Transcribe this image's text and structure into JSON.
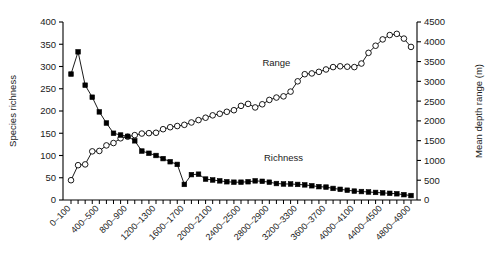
{
  "chart_data": {
    "type": "line",
    "title": "",
    "xlabel": "",
    "ylabel": "Species richness",
    "y2label": "Mean depth range (m)",
    "ylim": [
      0,
      400
    ],
    "y2lim": [
      0,
      4500
    ],
    "yticks": [
      0,
      50,
      100,
      150,
      200,
      250,
      300,
      350,
      400
    ],
    "y2ticks": [
      0,
      500,
      1000,
      1500,
      2000,
      2500,
      3000,
      3500,
      4000,
      4500
    ],
    "grid": false,
    "legend_position": "inline-annotations",
    "categories": [
      "0–100",
      "100–200",
      "200–300",
      "300–400",
      "400–500",
      "500–600",
      "600–700",
      "700–800",
      "800–900",
      "900–1000",
      "1000–1100",
      "1100–1200",
      "1200–1300",
      "1300–1400",
      "1400–1500",
      "1500–1600",
      "1600–1700",
      "1700–1800",
      "1800–1900",
      "1900–2000",
      "2000–2100",
      "2100–2200",
      "2200–2300",
      "2300–2400",
      "2400–2500",
      "2500–2600",
      "2600–2700",
      "2700–2800",
      "2800–2900",
      "2900–3000",
      "3000–3100",
      "3100–3200",
      "3200–3300",
      "3300–3400",
      "3400–3500",
      "3500–3600",
      "3600–3700",
      "3700–3800",
      "3800–3900",
      "3900–4000",
      "4000–4100",
      "4100–4200",
      "4200–4300",
      "4300–4400",
      "4400–4500",
      "4500–4600",
      "4600–4700",
      "4700–4800",
      "4800–4900"
    ],
    "xtick_labels_shown": [
      "0–100",
      "400–500",
      "800–900",
      "1200–1300",
      "1600–1700",
      "2000–2100",
      "2400–2500",
      "2800–2900",
      "3200–3300",
      "3600–3700",
      "4000–4100",
      "4400–4500",
      "4800–4900"
    ],
    "xtick_label_indices": [
      0,
      4,
      8,
      12,
      16,
      20,
      24,
      28,
      32,
      36,
      40,
      44,
      48
    ],
    "series": [
      {
        "name": "Richness",
        "axis": "left",
        "marker": "filled-square",
        "color": "#000000",
        "values": [
          283,
          333,
          258,
          231,
          198,
          173,
          150,
          146,
          143,
          133,
          110,
          105,
          100,
          93,
          86,
          80,
          35,
          57,
          58,
          47,
          45,
          43,
          41,
          40,
          40,
          41,
          43,
          42,
          40,
          37,
          36,
          36,
          35,
          34,
          32,
          30,
          29,
          26,
          24,
          22,
          20,
          19,
          18,
          17,
          16,
          15,
          14,
          12,
          10
        ]
      },
      {
        "name": "Range",
        "axis": "right",
        "marker": "open-circle",
        "color": "#000000",
        "values": [
          500,
          880,
          900,
          1230,
          1240,
          1380,
          1440,
          1560,
          1600,
          1640,
          1680,
          1690,
          1700,
          1790,
          1840,
          1870,
          1900,
          1960,
          2020,
          2080,
          2140,
          2180,
          2230,
          2270,
          2380,
          2430,
          2340,
          2420,
          2530,
          2590,
          2620,
          2740,
          3000,
          3180,
          3200,
          3240,
          3300,
          3360,
          3380,
          3370,
          3360,
          3450,
          3720,
          3900,
          4060,
          4170,
          4200,
          4080,
          3870
        ]
      }
    ],
    "annotations": [
      {
        "text": "Range",
        "x_index": 29,
        "y_value": 3380,
        "axis": "right"
      },
      {
        "text": "Richness",
        "x_index": 30,
        "y_value": 88,
        "axis": "left"
      }
    ]
  }
}
